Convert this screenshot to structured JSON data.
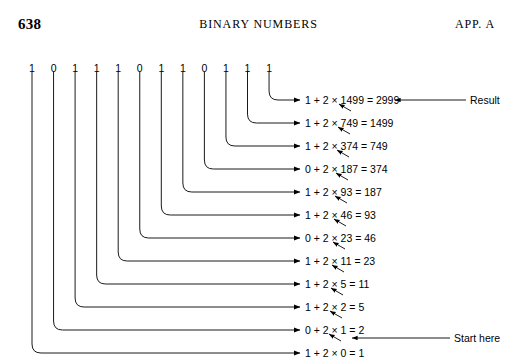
{
  "header": {
    "folio": "638",
    "book_title": "BINARY NUMBERS",
    "appendix": "APP.  A"
  },
  "figure": {
    "binary_digits": [
      "1",
      "0",
      "1",
      "1",
      "1",
      "0",
      "1",
      "1",
      "0",
      "1",
      "1",
      "1"
    ],
    "rows": [
      {
        "equation": "1 + 2 × 1499 = 2999"
      },
      {
        "equation": "1 + 2 × 749 = 1499"
      },
      {
        "equation": "1 + 2 × 374 = 749"
      },
      {
        "equation": "0 + 2 × 187 = 374"
      },
      {
        "equation": "1 + 2 × 93 = 187"
      },
      {
        "equation": "1 + 2 × 46 = 93"
      },
      {
        "equation": "0 + 2 × 23 = 46"
      },
      {
        "equation": "1 + 2 × 11 = 23"
      },
      {
        "equation": "1 + 2 × 5 = 11"
      },
      {
        "equation": "1 + 2 × 2 = 5"
      },
      {
        "equation": "0 + 2 × 1 = 2"
      },
      {
        "equation": "1 + 2 × 0 = 1"
      }
    ],
    "annotations": {
      "result_label": "Result",
      "start_label": "Start here"
    }
  },
  "colors": {
    "ink": "#000000",
    "page": "#ffffff"
  }
}
